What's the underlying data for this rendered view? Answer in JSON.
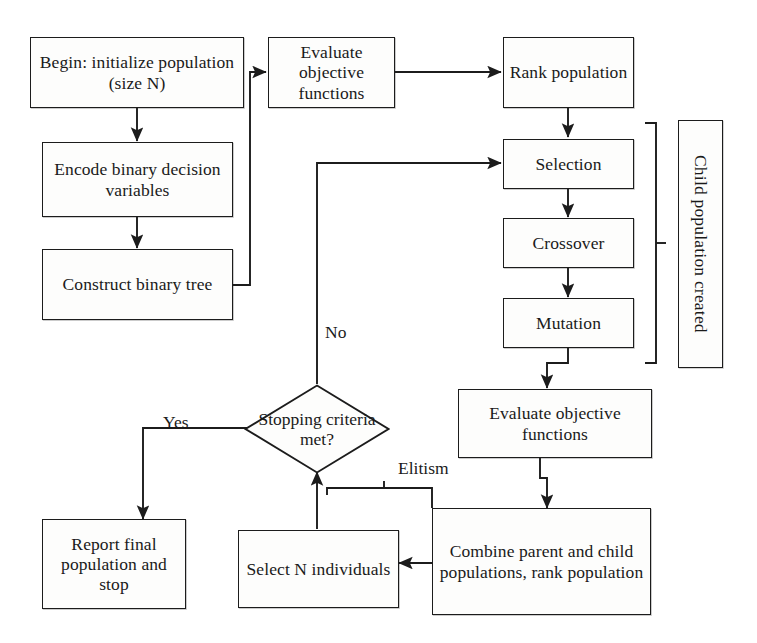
{
  "diagram": {
    "type": "flowchart",
    "stroke_color": "#1c1c1c",
    "fill_color": "#fdfdfc",
    "background": "#ffffff"
  },
  "nodes": {
    "begin": "Begin: initialize population (size N)",
    "encode": "Encode binary decision variables",
    "construct": "Construct binary tree",
    "evaluate_top": "Evaluate objective functions",
    "rank": "Rank population",
    "selection": "Selection",
    "crossover": "Crossover",
    "mutation": "Mutation",
    "child_population": "Child population created",
    "evaluate_bottom": "Evaluate objective functions",
    "stopping": "Stopping criteria met?",
    "report": "Report final population and stop",
    "select_n": "Select N individuals",
    "combine": "Combine parent and child populations, rank population"
  },
  "edge_labels": {
    "no": "No",
    "yes": "Yes",
    "elitism": "Elitism"
  }
}
